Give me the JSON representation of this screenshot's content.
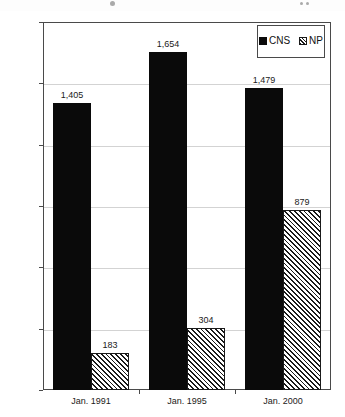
{
  "chart_data": {
    "type": "bar",
    "title": "",
    "xlabel": "",
    "ylabel": "",
    "categories": [
      "Jan. 1991",
      "Jan. 1995",
      "Jan. 2000"
    ],
    "series": [
      {
        "name": "CNS",
        "values": [
          1405,
          1654,
          1479
        ],
        "value_labels": [
          "1,405",
          "1,654",
          "1,479"
        ]
      },
      {
        "name": "NP",
        "values": [
          183,
          304,
          879
        ],
        "value_labels": [
          "183",
          "304",
          "879"
        ]
      }
    ],
    "ylim": [
      0,
      1800
    ],
    "yticks": [
      0,
      300,
      600,
      900,
      1200,
      1500,
      1800
    ],
    "ytick_labels": [
      "0",
      "300",
      "600",
      "900",
      "1,200",
      "1,500",
      "1,800"
    ],
    "grid": true,
    "legend_position": "top-right",
    "colors": {
      "cns": "#0a0a0a",
      "np_outline": "#1a1a1a",
      "np_fill": "#ffffff",
      "axis": "#4a4a4a",
      "grid": "#d3d3d3",
      "background": "#ffffff"
    }
  },
  "legend": {
    "entries": [
      {
        "label": "CNS",
        "swatch": "solid-black-swatch-icon"
      },
      {
        "label": "NP",
        "swatch": "diagonal-hatch-swatch-icon"
      }
    ]
  }
}
